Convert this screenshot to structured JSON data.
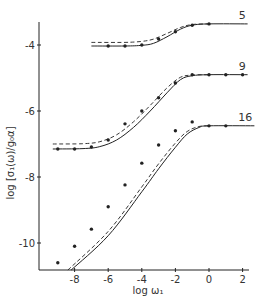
{
  "chart_data": {
    "type": "line",
    "title": "",
    "xlabel": "log ω₁",
    "ylabel": "log [σ₁(ω)/g₀α]",
    "xlim": [
      -9.8,
      2.3
    ],
    "ylim": [
      -11.0,
      -3.3
    ],
    "xticks": [
      -8,
      -6,
      -4,
      -2,
      0,
      2
    ],
    "xtick_labels": [
      "-8",
      "-6",
      "-4",
      "-2",
      "0",
      "2"
    ],
    "yticks": [
      -4,
      -6,
      -8,
      -10
    ],
    "ytick_labels": [
      "-4",
      "-6",
      "-8",
      "-10"
    ],
    "grid": false,
    "legend": "none (curves labelled directly at right end)",
    "series": [
      {
        "name": "5",
        "label": "5",
        "points": [
          [
            -6,
            -4.03
          ],
          [
            -5,
            -4.03
          ],
          [
            -4,
            -4.0
          ],
          [
            -3,
            -3.82
          ],
          [
            -2,
            -3.6
          ],
          [
            -1,
            -3.4
          ],
          [
            0,
            -3.36
          ]
        ],
        "solid": [
          [
            -7,
            -4.03
          ],
          [
            -5,
            -4.03
          ],
          [
            -4,
            -4.01
          ],
          [
            -3.3,
            -3.95
          ],
          [
            -2.5,
            -3.75
          ],
          [
            -1.7,
            -3.52
          ],
          [
            -1,
            -3.4
          ],
          [
            0,
            -3.36
          ],
          [
            2.3,
            -3.36
          ]
        ],
        "dashed": [
          [
            -7,
            -3.92
          ],
          [
            -5,
            -3.92
          ],
          [
            -4,
            -3.89
          ],
          [
            -3.3,
            -3.82
          ],
          [
            -2.5,
            -3.65
          ],
          [
            -1.7,
            -3.47
          ],
          [
            -1,
            -3.38
          ],
          [
            0,
            -3.36
          ]
        ]
      },
      {
        "name": "9",
        "label": "9",
        "points": [
          [
            -9,
            -7.15
          ],
          [
            -8,
            -7.15
          ],
          [
            -7,
            -7.09
          ],
          [
            -6,
            -6.88
          ],
          [
            -5,
            -6.39
          ],
          [
            -4,
            -6.0
          ],
          [
            -3,
            -5.6
          ],
          [
            -2,
            -5.15
          ],
          [
            -1,
            -4.9
          ],
          [
            0,
            -4.9
          ],
          [
            1,
            -4.9
          ],
          [
            2,
            -4.9
          ]
        ],
        "solid": [
          [
            -9.3,
            -7.15
          ],
          [
            -7.5,
            -7.14
          ],
          [
            -6.5,
            -7.08
          ],
          [
            -5.5,
            -6.88
          ],
          [
            -4.5,
            -6.5
          ],
          [
            -3.5,
            -6.0
          ],
          [
            -2.5,
            -5.45
          ],
          [
            -1.7,
            -5.05
          ],
          [
            -1,
            -4.93
          ],
          [
            0,
            -4.9
          ],
          [
            2.3,
            -4.9
          ]
        ],
        "dashed": [
          [
            -9.3,
            -7.0
          ],
          [
            -7.5,
            -6.99
          ],
          [
            -6.5,
            -6.93
          ],
          [
            -5.5,
            -6.72
          ],
          [
            -4.5,
            -6.33
          ],
          [
            -3.5,
            -5.83
          ],
          [
            -2.5,
            -5.3
          ],
          [
            -1.7,
            -4.98
          ],
          [
            -1,
            -4.91
          ],
          [
            0,
            -4.9
          ]
        ]
      },
      {
        "name": "16",
        "label": "16",
        "points": [
          [
            -9,
            -10.6
          ],
          [
            -8,
            -10.1
          ],
          [
            -7,
            -9.58
          ],
          [
            -6,
            -8.9
          ],
          [
            -5,
            -8.24
          ],
          [
            -4,
            -7.58
          ],
          [
            -3,
            -7.03
          ],
          [
            -2,
            -6.6
          ],
          [
            -1,
            -6.33
          ],
          [
            0,
            -6.45
          ],
          [
            1,
            -6.45
          ]
        ],
        "solid": [
          [
            -8.2,
            -11.0
          ],
          [
            -6,
            -9.78
          ],
          [
            -4,
            -8.45
          ],
          [
            -3,
            -7.75
          ],
          [
            -2,
            -7.1
          ],
          [
            -1.3,
            -6.7
          ],
          [
            -0.6,
            -6.5
          ],
          [
            0,
            -6.45
          ],
          [
            2.7,
            -6.45
          ]
        ],
        "dashed": [
          [
            -8.4,
            -11.0
          ],
          [
            -6,
            -9.65
          ],
          [
            -4,
            -8.3
          ],
          [
            -3,
            -7.6
          ],
          [
            -2,
            -6.97
          ],
          [
            -1.3,
            -6.62
          ],
          [
            -0.6,
            -6.47
          ],
          [
            0,
            -6.45
          ]
        ]
      }
    ]
  },
  "colors": {
    "ink": "#222222",
    "background": "#ffffff"
  }
}
